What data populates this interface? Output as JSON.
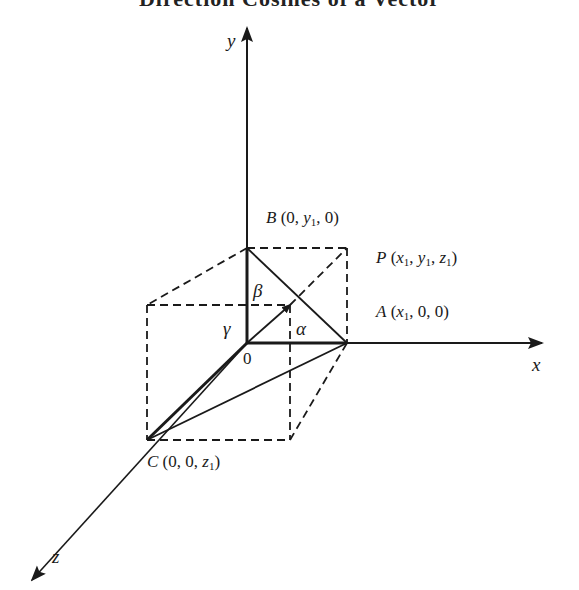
{
  "title": "Direction Cosines of a Vector",
  "axes": {
    "x_label": "x",
    "y_label": "y",
    "z_label": "z",
    "origin_label": "0"
  },
  "points": {
    "A": {
      "name": "A",
      "coords": [
        "x",
        "0",
        "0"
      ],
      "sub_index": "1"
    },
    "B": {
      "name": "B",
      "coords": [
        "0",
        "y",
        "0"
      ],
      "sub_index": "1"
    },
    "C": {
      "name": "C",
      "coords": [
        "0",
        "0",
        "z"
      ],
      "sub_index": "1"
    },
    "P": {
      "name": "P",
      "coords": [
        "x",
        "y",
        "z"
      ],
      "sub_index": "1"
    }
  },
  "angles": {
    "alpha": "α",
    "beta": "β",
    "gamma": "γ"
  },
  "colors": {
    "line": "#1a1a1a",
    "background": "#ffffff"
  }
}
